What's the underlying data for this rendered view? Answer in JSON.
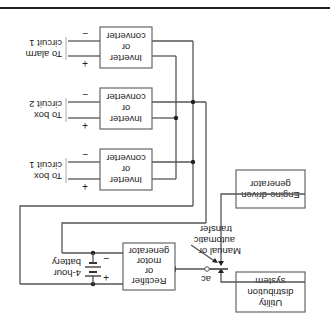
{
  "diagram": {
    "orientation": "rotated 180 degrees",
    "blocks": {
      "utility": {
        "lines": [
          "Utility",
          "distribution",
          "system"
        ]
      },
      "engine": {
        "lines": [
          "Engine-driven",
          "generator"
        ]
      },
      "transfer_label": {
        "lines": [
          "Manual or",
          "automatic",
          "transfer"
        ]
      },
      "ac_label": "ac",
      "rectifier": {
        "lines": [
          "Rectifier",
          "or",
          "motor",
          "generator"
        ]
      },
      "battery": {
        "lines": [
          "4-hour",
          "battery"
        ]
      },
      "inverters": [
        {
          "lines": [
            "Inverter",
            "or",
            "converter"
          ],
          "output": [
            "To box",
            "circuit 1"
          ]
        },
        {
          "lines": [
            "Inverter",
            "or",
            "converter"
          ],
          "output": [
            "To box",
            "circuit 2"
          ]
        },
        {
          "lines": [
            "Inverter",
            "or",
            "converter"
          ],
          "output": [
            "To alarm",
            "circuit 1"
          ]
        }
      ],
      "plus_sign": "+",
      "minus_sign": "−"
    }
  }
}
